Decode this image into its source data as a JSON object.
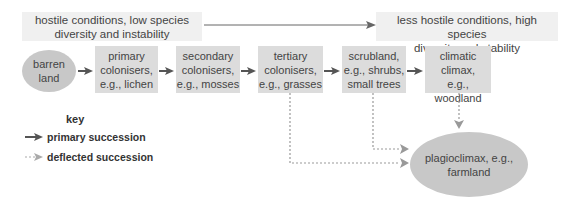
{
  "diagram": {
    "type": "succession flowchart",
    "banners": {
      "left": {
        "line1": "hostile conditions, low species",
        "line2": "diversity and instability"
      },
      "right": {
        "line1": "less hostile conditions, high species",
        "line2": "diversity and stability"
      }
    },
    "stages": [
      {
        "id": "barren",
        "line1": "barren",
        "line2": "land",
        "shape": "ellipse"
      },
      {
        "id": "primary",
        "line1": "primary",
        "line2": "colonisers,",
        "line3": "e.g., lichen"
      },
      {
        "id": "secondary",
        "line1": "secondary",
        "line2": "colonisers,",
        "line3": "e.g., mosses"
      },
      {
        "id": "tertiary",
        "line1": "tertiary",
        "line2": "colonisers,",
        "line3": "e.g., grasses"
      },
      {
        "id": "scrubland",
        "line1": "scrubland,",
        "line2": "e.g., shrubs,",
        "line3": "small trees"
      },
      {
        "id": "climatic",
        "line1": "climatic",
        "line2": "climax,",
        "line3": "e.g., woodland"
      }
    ],
    "plagioclimax": {
      "line1": "plagioclimax, e.g.,",
      "line2": "farmland"
    },
    "key": {
      "title": "key",
      "primary": "primary succession",
      "deflected": "deflected succession"
    },
    "colors": {
      "box_fill": "#dcdcdc",
      "ellipse_fill": "#c8c8c8",
      "banner_fill": "#f0f0f0",
      "primary_arrow": "#555555",
      "deflected_arrow": "#999999"
    }
  }
}
